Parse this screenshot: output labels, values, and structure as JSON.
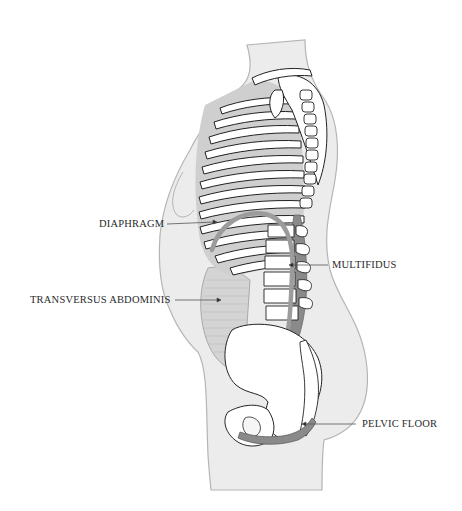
{
  "diagram": {
    "colors": {
      "body_fill": "#ececec",
      "body_outline": "#b5b5b5",
      "bone_fill": "#ffffff",
      "bone_outline": "#222222",
      "muscle_mid": "#c9c9c9",
      "muscle_dark": "#8a8a8a",
      "leader_line": "#555555"
    },
    "labels": [
      {
        "id": "diaphragm",
        "text": "DIAPHRAGM"
      },
      {
        "id": "multifidus",
        "text": "MULTIFIDUS"
      },
      {
        "id": "transversus-abdominis",
        "text": "TRANSVERSUS ABDOMINIS"
      },
      {
        "id": "pelvic-floor",
        "text": "PELVIC FLOOR"
      }
    ]
  }
}
